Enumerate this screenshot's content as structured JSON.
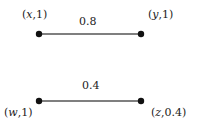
{
  "graph": {
    "nodes": [
      {
        "id": "x",
        "name": "x",
        "value": "1",
        "label": "(x, 1)",
        "pos": [
          39,
          34
        ]
      },
      {
        "id": "y",
        "name": "y",
        "value": "1",
        "label": "(y, 1)",
        "pos": [
          141,
          34
        ]
      },
      {
        "id": "w",
        "name": "w",
        "value": "1",
        "label": "(w, 1)",
        "pos": [
          39,
          101
        ]
      },
      {
        "id": "z",
        "name": "z",
        "value": "0.4",
        "label": "(z, 0.4)",
        "pos": [
          141,
          101
        ]
      }
    ],
    "edges": [
      {
        "from": "x",
        "to": "y",
        "weight": "0.8"
      },
      {
        "from": "w",
        "to": "z",
        "weight": "0.4"
      }
    ]
  },
  "colors": {
    "node": "#111111",
    "edge": "#555555",
    "text": "#222222"
  }
}
